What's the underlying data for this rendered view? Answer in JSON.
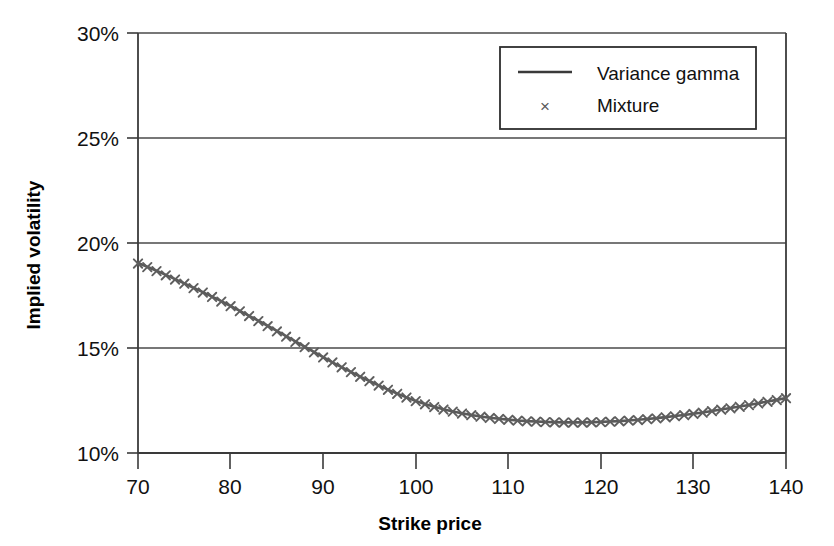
{
  "chart_data": {
    "type": "line",
    "title": "",
    "subtitle": "",
    "xlabel": "Strike price",
    "ylabel": "Implied volatility",
    "xlim": [
      70,
      140
    ],
    "ylim": [
      10,
      30
    ],
    "xticks": [
      "70",
      "80",
      "90",
      "100",
      "110",
      "120",
      "130",
      "140"
    ],
    "yticks": [
      "10%",
      "15%",
      "20%",
      "25%",
      "30%"
    ],
    "grid": "horizontal",
    "legend_position": "top-right",
    "y_unit": "percent",
    "series": [
      {
        "name": "Variance gamma",
        "style": "line",
        "color": "#595959",
        "x": [
          70,
          71,
          72,
          73,
          74,
          75,
          76,
          77,
          78,
          79,
          80,
          81,
          82,
          83,
          84,
          85,
          86,
          87,
          88,
          89,
          90,
          91,
          92,
          93,
          94,
          95,
          96,
          97,
          98,
          99,
          100,
          101,
          102,
          103,
          104,
          105,
          106,
          107,
          108,
          109,
          110,
          111,
          112,
          113,
          114,
          115,
          116,
          117,
          118,
          119,
          120,
          121,
          122,
          123,
          124,
          125,
          126,
          127,
          128,
          129,
          130,
          131,
          132,
          133,
          134,
          135,
          136,
          137,
          138,
          139,
          140
        ],
        "values": [
          19.05,
          18.87,
          18.68,
          18.48,
          18.28,
          18.08,
          17.87,
          17.66,
          17.45,
          17.23,
          17.0,
          16.77,
          16.53,
          16.3,
          16.06,
          15.81,
          15.56,
          15.31,
          15.06,
          14.81,
          14.57,
          14.32,
          14.09,
          13.86,
          13.64,
          13.43,
          13.22,
          13.02,
          12.83,
          12.65,
          12.48,
          12.33,
          12.2,
          12.08,
          11.98,
          11.89,
          11.81,
          11.74,
          11.68,
          11.63,
          11.59,
          11.55,
          11.52,
          11.5,
          11.48,
          11.47,
          11.46,
          11.46,
          11.46,
          11.47,
          11.48,
          11.5,
          11.52,
          11.55,
          11.58,
          11.62,
          11.66,
          11.71,
          11.76,
          11.81,
          11.87,
          11.93,
          12.0,
          12.07,
          12.14,
          12.21,
          12.29,
          12.37,
          12.45,
          12.53,
          12.62
        ]
      },
      {
        "name": "Mixture",
        "style": "marker",
        "marker": "x",
        "color": "#5e5e5e",
        "x": [
          70,
          71,
          72,
          73,
          74,
          75,
          76,
          77,
          78,
          79,
          80,
          81,
          82,
          83,
          84,
          85,
          86,
          87,
          88,
          89,
          90,
          91,
          92,
          93,
          94,
          95,
          96,
          97,
          98,
          99,
          100,
          101,
          102,
          103,
          104,
          105,
          106,
          107,
          108,
          109,
          110,
          111,
          112,
          113,
          114,
          115,
          116,
          117,
          118,
          119,
          120,
          121,
          122,
          123,
          124,
          125,
          126,
          127,
          128,
          129,
          130,
          131,
          132,
          133,
          134,
          135,
          136,
          137,
          138,
          139,
          140
        ],
        "values": [
          19.02,
          18.85,
          18.66,
          18.46,
          18.26,
          18.06,
          17.85,
          17.64,
          17.43,
          17.21,
          16.99,
          16.75,
          16.52,
          16.28,
          16.04,
          15.79,
          15.54,
          15.29,
          15.04,
          14.79,
          14.55,
          14.31,
          14.08,
          13.85,
          13.63,
          13.42,
          13.21,
          13.01,
          12.82,
          12.64,
          12.47,
          12.32,
          12.19,
          12.07,
          11.97,
          11.88,
          11.8,
          11.73,
          11.67,
          11.62,
          11.58,
          11.54,
          11.51,
          11.49,
          11.47,
          11.46,
          11.45,
          11.45,
          11.45,
          11.46,
          11.47,
          11.49,
          11.51,
          11.54,
          11.57,
          11.61,
          11.65,
          11.7,
          11.75,
          11.8,
          11.86,
          11.92,
          11.99,
          12.06,
          12.13,
          12.2,
          12.28,
          12.36,
          12.44,
          12.52,
          12.61
        ]
      }
    ]
  },
  "axes": {
    "y_axis_title": "Implied volatility",
    "x_axis_title": "Strike price",
    "y_tick_labels": [
      "30%",
      "25%",
      "20%",
      "15%",
      "10%"
    ],
    "x_tick_labels": [
      "70",
      "80",
      "90",
      "100",
      "110",
      "120",
      "130",
      "140"
    ]
  },
  "legend": {
    "items": [
      {
        "label": "Variance gamma",
        "glyph": "line"
      },
      {
        "label": "Mixture",
        "glyph": "x"
      }
    ],
    "marker_glyph": "×"
  },
  "colors": {
    "series": "#595959",
    "axis": "#3a3a3a",
    "grid": "#4a4a4a",
    "text": "#111111",
    "background": "#ffffff"
  }
}
